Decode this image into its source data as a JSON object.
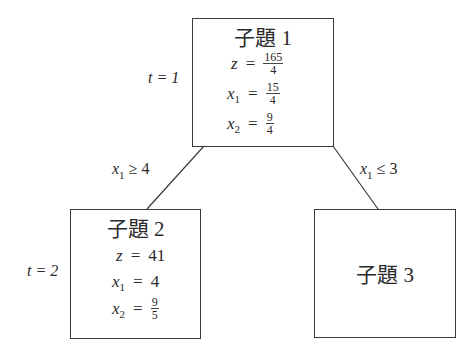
{
  "nodes": [
    {
      "id": "node1",
      "title": "子題 1",
      "iteration_label": "t = 1",
      "equations": [
        {
          "var": "z",
          "sub": "",
          "num": "165",
          "den": "4"
        },
        {
          "var": "x",
          "sub": "1",
          "num": "15",
          "den": "4"
        },
        {
          "var": "x",
          "sub": "2",
          "num": "9",
          "den": "4"
        }
      ]
    },
    {
      "id": "node2",
      "title": "子題 2",
      "iteration_label": "t = 2",
      "equations": [
        {
          "var": "z",
          "sub": "",
          "value": "41"
        },
        {
          "var": "x",
          "sub": "1",
          "value": "4"
        },
        {
          "var": "x",
          "sub": "2",
          "num": "9",
          "den": "5"
        }
      ]
    },
    {
      "id": "node3",
      "title": "子題 3"
    }
  ],
  "edges": [
    {
      "from": "node1",
      "to": "node2",
      "label_var": "x",
      "label_sub": "1",
      "label_rel": "≥ 4"
    },
    {
      "from": "node1",
      "to": "node3",
      "label_var": "x",
      "label_sub": "1",
      "label_rel": "≤ 3"
    }
  ],
  "colors": {
    "line": "#3a3a3a",
    "text": "#2a2a2a",
    "background": "#ffffff"
  }
}
